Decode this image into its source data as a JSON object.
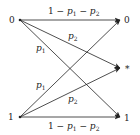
{
  "diagram": {
    "title": "",
    "inputs": [
      {
        "id": "in0",
        "label": "0"
      },
      {
        "id": "in1",
        "label": "1"
      }
    ],
    "outputs": [
      {
        "id": "out0",
        "label": "0"
      },
      {
        "id": "outE",
        "label": "*"
      },
      {
        "id": "out1",
        "label": "1"
      }
    ],
    "edges": [
      {
        "from": "0",
        "to": "0",
        "label": "1 − p1 − p2",
        "label_main": "1 − ",
        "p1": "p",
        "sub1": "1",
        "minus": " − ",
        "p2": "p",
        "sub2": "2"
      },
      {
        "from": "0",
        "to": "*",
        "label": "p2",
        "p": "p",
        "sub": "2"
      },
      {
        "from": "0",
        "to": "1",
        "label": "p1",
        "p": "p",
        "sub": "1"
      },
      {
        "from": "1",
        "to": "0",
        "label": "p1",
        "p": "p",
        "sub": "1"
      },
      {
        "from": "1",
        "to": "*",
        "label": "p2",
        "p": "p",
        "sub": "2"
      },
      {
        "from": "1",
        "to": "1",
        "label": "1 − p1 − p2",
        "label_main": "1 − ",
        "p1": "p",
        "sub1": "1",
        "minus": " − ",
        "p2": "p",
        "sub2": "2"
      }
    ]
  }
}
